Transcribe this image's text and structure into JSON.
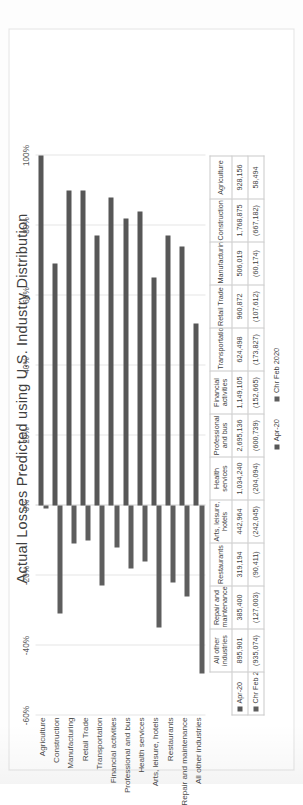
{
  "chart_data": {
    "type": "bar",
    "title": "Actual Losses Predicted using U.S. Industry Distribution",
    "orientation": "vertical",
    "xlabel": "",
    "ylabel": "",
    "ylim": [
      -60,
      100
    ],
    "yticks": [
      "-60%",
      "-40%",
      "-20%",
      "0%",
      "20%",
      "40%",
      "60%",
      "80%",
      "100%"
    ],
    "ytick_values": [
      -60,
      -40,
      -20,
      0,
      20,
      40,
      60,
      80,
      100
    ],
    "grid": true,
    "legend_position": "bottom",
    "categories": [
      "Agriculture",
      "Construction",
      "Manufacturing",
      "Retail Trade",
      "Transportation",
      "Financial activities",
      "Professional and bus",
      "Health services",
      "Arts, leisure, hotels",
      "Restaurants",
      "Repair and maintenance",
      "All other industries"
    ],
    "series": [
      {
        "name": "Apr-20",
        "color": "#575757",
        "values": [
          100,
          69,
          90,
          90,
          77,
          88,
          82,
          84,
          65,
          77,
          74,
          52
        ]
      },
      {
        "name": "Chr Feb 2020",
        "color": "#5e5e5e",
        "values": [
          -1,
          -31,
          -11,
          -10,
          -23,
          -12,
          -18,
          -16,
          -35,
          -22,
          -26,
          -48
        ]
      }
    ],
    "table": {
      "columns": [
        "Agriculture",
        "Construction",
        "Manufacturing",
        "Retail Trade",
        "Transportation",
        "Financial activities",
        "Professional and bus",
        "Health services",
        "Arts, leisure, hotels",
        "Restaurants",
        "Repair and maintenance",
        "All other industries"
      ],
      "rows": [
        {
          "label": "Apr-20",
          "values": [
            "928,156",
            "1,768,875",
            "506,019",
            "960,872",
            "624,498",
            "1,149,105",
            "2,695,136",
            "1,034,240",
            "442,964",
            "319,194",
            "385,400",
            "895,901"
          ]
        },
        {
          "label": "Chr Feb 2020",
          "values": [
            "58,494",
            "(667,182)",
            "(60,174)",
            "(107,612)",
            "(173,827)",
            "(152,665)",
            "(600,739)",
            "(204,094)",
            "(242,045)",
            "(90,411)",
            "(127,003)",
            "(935,074)"
          ]
        }
      ]
    }
  }
}
